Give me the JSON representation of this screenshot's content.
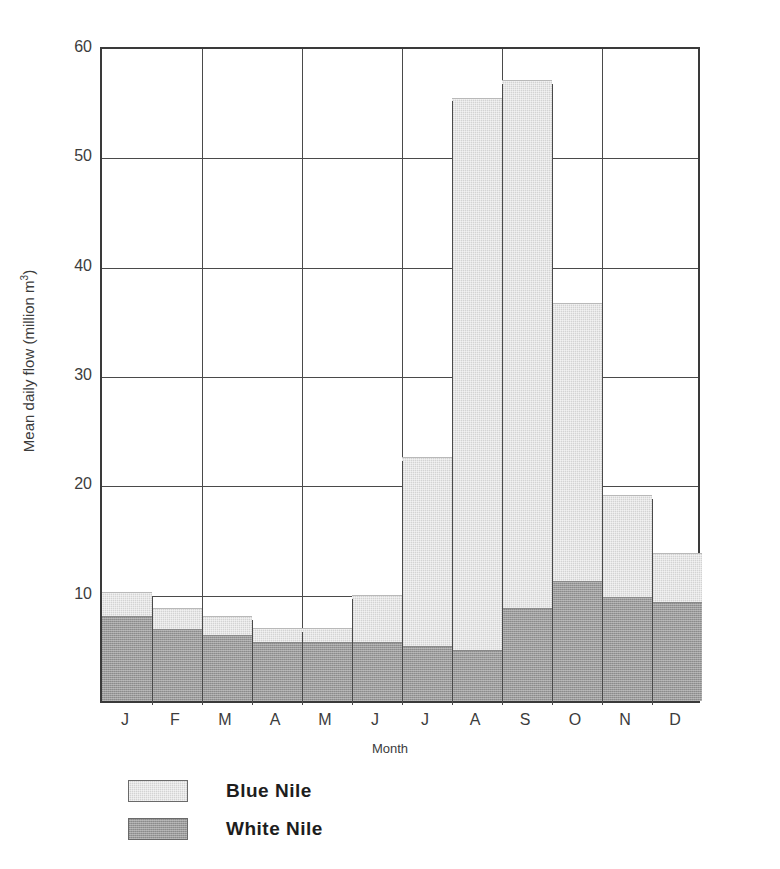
{
  "chart_data": {
    "type": "bar",
    "stacked": true,
    "title": "",
    "xlabel": "Month",
    "ylabel": "Mean daily flow (million m³)",
    "categories": [
      "J",
      "F",
      "M",
      "A",
      "M",
      "J",
      "J",
      "A",
      "S",
      "O",
      "N",
      "D"
    ],
    "category_full_names": [
      "January",
      "February",
      "March",
      "April",
      "May",
      "June",
      "July",
      "August",
      "September",
      "October",
      "November",
      "December"
    ],
    "series": [
      {
        "name": "White Nile",
        "color": "#9b9b9b",
        "values": [
          7.8,
          6.6,
          6.0,
          5.4,
          5.4,
          5.4,
          5.0,
          4.7,
          8.5,
          11.0,
          9.5,
          9.1
        ]
      },
      {
        "name": "Blue Nile",
        "color": "#d3d3d3",
        "values": [
          2.2,
          1.9,
          1.8,
          1.3,
          1.3,
          4.3,
          17.3,
          50.5,
          48.3,
          25.4,
          9.3,
          4.4
        ]
      }
    ],
    "totals": [
      10.0,
      8.5,
      7.8,
      6.7,
      6.7,
      9.7,
      22.3,
      55.2,
      56.8,
      36.4,
      18.8,
      13.5
    ],
    "ylim": [
      0,
      60
    ],
    "yticks": [
      10,
      20,
      30,
      40,
      50,
      60
    ],
    "ytick_labels": [
      "10",
      "20",
      "30",
      "40",
      "50",
      "60"
    ],
    "xlim": [
      0,
      12
    ],
    "grid": true,
    "grid_axis": "both",
    "legend_position": "below-left",
    "legend_order": [
      "Blue Nile",
      "White Nile"
    ]
  },
  "axes": {
    "y_title_main": "Mean daily flow (million m",
    "y_title_sup": "3",
    "y_title_close": ")",
    "x_title": "Month"
  },
  "legend": {
    "entries": [
      {
        "label": "Blue Nile",
        "series": "Blue Nile"
      },
      {
        "label": "White Nile",
        "series": "White Nile"
      }
    ]
  },
  "colors": {
    "blue_nile": "#d3d3d3",
    "white_nile": "#9b9b9b",
    "axis": "#3a3a3a",
    "grid": "#4a4a4a",
    "background": "#ffffff",
    "text": "#3c3c3c"
  }
}
